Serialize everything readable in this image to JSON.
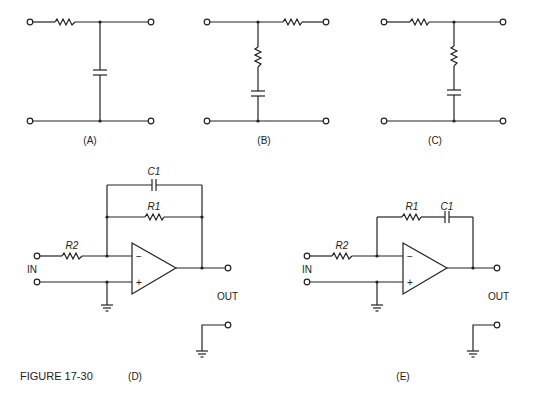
{
  "figure": {
    "caption": "FIGURE 17-30"
  },
  "panels": {
    "A": {
      "label": "(A)",
      "description": "RC low-pass network: series resistor, shunt capacitor"
    },
    "B": {
      "label": "(B)",
      "description": "Series resistor output with shunt resistor+capacitor branch"
    },
    "C": {
      "label": "(C)",
      "description": "Series resistor input with shunt resistor+capacitor branch"
    },
    "D": {
      "label": "(D)",
      "components": {
        "c1": "C1",
        "r1": "R1",
        "r2": "R2"
      },
      "input_label": "IN",
      "output_label": "OUT",
      "opamp": {
        "minus": "−",
        "plus": "+"
      }
    },
    "E": {
      "label": "(E)",
      "components": {
        "c1": "C1",
        "r1": "R1",
        "r2": "R2"
      },
      "input_label": "IN",
      "output_label": "OUT",
      "opamp": {
        "minus": "−",
        "plus": "+"
      }
    }
  }
}
